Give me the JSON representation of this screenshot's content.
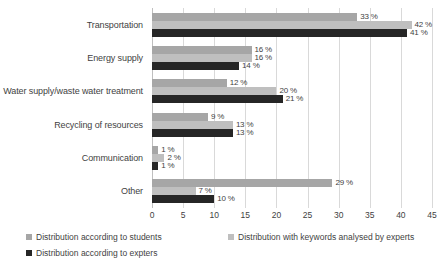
{
  "chart_data": {
    "type": "bar",
    "orientation": "horizontal",
    "title": "",
    "xlabel": "",
    "ylabel": "",
    "xlim": [
      0,
      45
    ],
    "xticks": [
      0,
      5,
      10,
      15,
      20,
      25,
      30,
      35,
      40,
      45
    ],
    "xtick_labels": [
      "0",
      "5",
      "10",
      "15",
      "20",
      "25",
      "30",
      "35",
      "40",
      "45"
    ],
    "grid": true,
    "grid_axis": "x",
    "legend_position": "bottom-left",
    "value_suffix": " %",
    "categories": [
      "Transportation",
      "Energy supply",
      "Water supply/waste water treatment",
      "Recycling of resources",
      "Communication",
      "Other"
    ],
    "series": [
      {
        "name": "Distribution according to students",
        "color": "#a6a6a6",
        "values": [
          33,
          16,
          12,
          9,
          1,
          29
        ],
        "labels": [
          "33 %",
          "16 %",
          "12 %",
          "9 %",
          "1 %",
          "29 %"
        ]
      },
      {
        "name": "Distribution with keywords analysed by experts",
        "color": "#bfbfbf",
        "values": [
          42,
          16,
          20,
          13,
          2,
          7
        ],
        "labels": [
          "42 %",
          "16 %",
          "20 %",
          "13 %",
          "2 %",
          "7 %"
        ]
      },
      {
        "name": "Distribution according to expters",
        "color": "#262626",
        "values": [
          41,
          14,
          21,
          13,
          1,
          10
        ],
        "labels": [
          "41 %",
          "14 %",
          "21 %",
          "13 %",
          "1 %",
          "10 %"
        ]
      }
    ]
  }
}
